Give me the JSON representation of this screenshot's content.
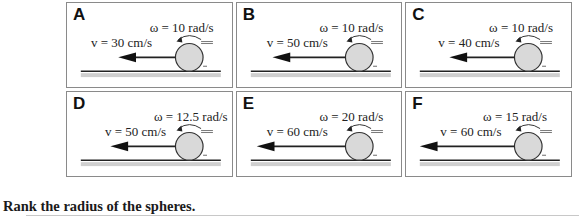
{
  "panels": [
    {
      "label": "A",
      "omega": "ω = 10 rad/s",
      "velocity": "v = 30 cm/s"
    },
    {
      "label": "B",
      "omega": "ω = 10 rad/s",
      "velocity": "v = 50 cm/s"
    },
    {
      "label": "C",
      "omega": "ω = 10 rad/s",
      "velocity": "v = 40 cm/s"
    },
    {
      "label": "D",
      "omega": "ω = 12.5 rad/s",
      "velocity": "v = 50 cm/s"
    },
    {
      "label": "E",
      "omega": "ω = 20 rad/s",
      "velocity": "v = 60 cm/s"
    },
    {
      "label": "F",
      "omega": "ω = 15 rad/s",
      "velocity": "v = 60 cm/s"
    }
  ],
  "question": "Rank the radius of the spheres.",
  "colors": {
    "border": "#8a8a8a",
    "sphere_fill": "#d9d9d9",
    "ground": "#222222",
    "ground_shadow": "#bdbdbd"
  }
}
